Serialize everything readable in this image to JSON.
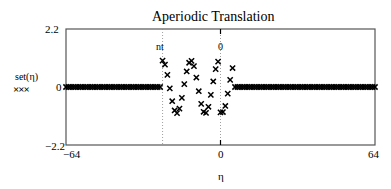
{
  "chart_data": {
    "type": "scatter",
    "title": "Aperiodic Translation",
    "xlabel": "η",
    "ylabel": "set(η)",
    "legend": [
      {
        "label": "set(η)",
        "marker": "×××"
      }
    ],
    "xlim": [
      -64,
      64
    ],
    "ylim": [
      -2.2,
      2.2
    ],
    "x_tick_labels": [
      "-64",
      "0",
      "64"
    ],
    "y_tick_labels": [
      "2.2",
      "0",
      "-2.2"
    ],
    "markers": [
      {
        "label": "nt",
        "x": -24,
        "style": "dotted"
      },
      {
        "label": "0",
        "x": 0,
        "style": "dotted"
      }
    ],
    "grid": false,
    "series": [
      {
        "name": "set(η)",
        "marker": "x",
        "color": "#000000",
        "segments": [
          {
            "description": "zero before nt",
            "x_range": [
              -64,
              -25
            ],
            "value": 0
          },
          {
            "description": "cosine pulse",
            "x": [
              -24,
              -23,
              -22,
              -21,
              -20,
              -19,
              -18,
              -17,
              -16,
              -15,
              -14,
              -13,
              -12,
              -11,
              -10,
              -9,
              -8,
              -7,
              -6,
              -5,
              -4,
              -3,
              -2,
              -1,
              0,
              1,
              2,
              3,
              4,
              5
            ],
            "values": [
              1.0,
              0.85,
              0.46,
              -0.05,
              -0.54,
              -0.89,
              -0.99,
              -0.82,
              -0.41,
              0.11,
              0.59,
              0.92,
              0.99,
              0.79,
              0.36,
              -0.16,
              -0.64,
              -0.94,
              -0.98,
              -0.75,
              -0.3,
              0.21,
              0.68,
              0.96,
              -0.96,
              -0.95,
              -0.72,
              -0.25,
              0.27,
              0.72
            ]
          },
          {
            "description": "zero after pulse",
            "x_range": [
              6,
              64
            ],
            "value": 0
          }
        ]
      }
    ]
  },
  "labels": {
    "title": "Aperiodic Translation",
    "y_max": "2.2",
    "y_zero": "0",
    "y_min": "−2.2",
    "x_min": "−64",
    "x_zero": "0",
    "x_max": "64",
    "x_axis": "η",
    "legend_name": "set(η)",
    "legend_marker": "×××",
    "marker_nt": "nt",
    "marker_zero": "0"
  }
}
